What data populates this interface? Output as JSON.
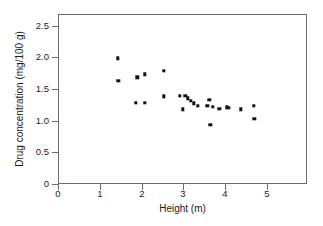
{
  "chart_data": {
    "type": "scatter",
    "title": "",
    "xlabel": "Height (m)",
    "ylabel": "Drug concentration (mg/100 g)",
    "xlim": [
      0,
      5.4
    ],
    "ylim": [
      0,
      2.68
    ],
    "xticks": [
      "0",
      "1",
      "2",
      "3",
      "4",
      "5"
    ],
    "xtick_values": [
      0,
      1,
      2,
      3,
      4,
      5
    ],
    "yticks": [
      "0",
      "0.5",
      "1.0",
      "1.5",
      "2.0",
      "2.5"
    ],
    "ytick_values": [
      0,
      0.5,
      1.0,
      1.5,
      2.0,
      2.5
    ],
    "grid": false,
    "legend": null,
    "marker": "filled-square",
    "marker_color": "#111111",
    "series": [
      {
        "name": "Drug concentration",
        "points": [
          [
            1.3,
            1.98
          ],
          [
            1.31,
            1.63
          ],
          [
            1.69,
            1.28
          ],
          [
            1.72,
            1.68
          ],
          [
            1.88,
            1.73
          ],
          [
            1.88,
            1.28
          ],
          [
            2.3,
            1.78
          ],
          [
            2.3,
            1.38
          ],
          [
            2.64,
            1.39
          ],
          [
            2.7,
            1.18
          ],
          [
            2.76,
            1.39
          ],
          [
            2.82,
            1.35
          ],
          [
            2.88,
            1.31
          ],
          [
            2.95,
            1.27
          ],
          [
            3.03,
            1.23
          ],
          [
            3.24,
            1.23
          ],
          [
            3.28,
            1.33
          ],
          [
            3.3,
            0.93
          ],
          [
            3.36,
            1.22
          ],
          [
            3.5,
            1.19
          ],
          [
            3.66,
            1.21
          ],
          [
            3.71,
            1.2
          ],
          [
            3.97,
            1.18
          ],
          [
            4.25,
            1.23
          ],
          [
            4.26,
            1.03
          ]
        ]
      }
    ]
  }
}
